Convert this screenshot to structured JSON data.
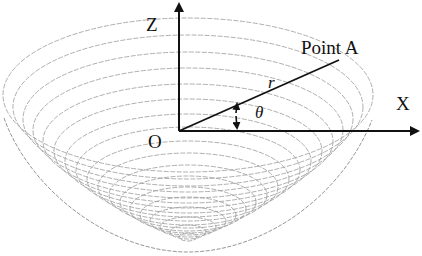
{
  "diagram": {
    "type": "paraboloid-coordinate-diagram",
    "labels": {
      "z_axis": "Z",
      "x_axis": "X",
      "origin": "O",
      "point": "Point A",
      "radius": "r",
      "angle": "θ"
    },
    "colors": {
      "axes": "#111111",
      "mesh": "#9a9a9a",
      "background": "#ffffff"
    },
    "mesh": {
      "contour_count": 18,
      "description": "concentric elliptical contour lines forming a bowl-shaped paraboloid surface"
    }
  }
}
